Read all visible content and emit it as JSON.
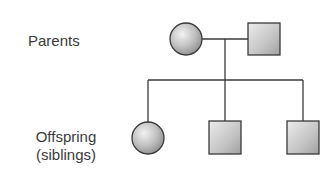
{
  "diagram": {
    "type": "pedigree",
    "labels": {
      "parents": "Parents",
      "offspring_line1": "Offspring",
      "offspring_line2": "(siblings)"
    },
    "generations": [
      {
        "name": "Parents",
        "members": [
          {
            "sex": "female",
            "shape": "circle",
            "affected": false
          },
          {
            "sex": "male",
            "shape": "square",
            "affected": false
          }
        ]
      },
      {
        "name": "Offspring (siblings)",
        "members": [
          {
            "sex": "female",
            "shape": "circle",
            "affected": false
          },
          {
            "sex": "male",
            "shape": "square",
            "affected": false
          },
          {
            "sex": "male",
            "shape": "square",
            "affected": false
          }
        ]
      }
    ],
    "colors": {
      "line": "#3a3a3a",
      "fill_light": "#eeeeee",
      "fill_dark": "#9a9a9a",
      "text": "#3a3a3a"
    }
  }
}
